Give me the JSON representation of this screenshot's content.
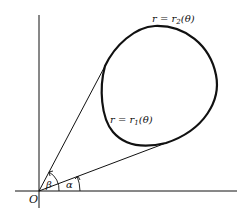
{
  "diagram": {
    "origin_label": "O",
    "curve_outer_label": "r = r",
    "curve_outer_sub": "2",
    "curve_outer_arg": "(θ)",
    "curve_inner_label": "r = r",
    "curve_inner_sub": "1",
    "curve_inner_arg": "(θ)",
    "angle_alpha": "α",
    "angle_beta": "β",
    "colors": {
      "stroke": "#111111",
      "background": "#ffffff"
    }
  }
}
